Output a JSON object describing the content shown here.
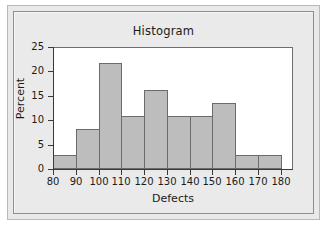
{
  "figure": {
    "title": "Histogram",
    "bar_fill_color": "#bdbdbd",
    "bar_edge_color": "#6b6b6b",
    "axis_color": "#3a3a3a",
    "plot_background": "#ffffff",
    "panel_background": "#e9e9e9"
  },
  "chart_data": {
    "type": "bar",
    "title": "Histogram",
    "xlabel": "Defects",
    "ylabel": "Percent",
    "xlim": [
      80,
      185
    ],
    "ylim": [
      0,
      25
    ],
    "bin_width": 10,
    "grid": false,
    "legend": null,
    "x_ticks": [
      80,
      90,
      100,
      110,
      120,
      130,
      140,
      150,
      160,
      170,
      180
    ],
    "x_tick_labels": [
      "80",
      "90",
      "100",
      "110",
      "120",
      "130",
      "140",
      "150",
      "160",
      "170",
      "180"
    ],
    "y_ticks": [
      0,
      5,
      10,
      15,
      20,
      25
    ],
    "y_tick_labels": [
      "0",
      "5",
      "10",
      "15",
      "20",
      "25"
    ],
    "bins": [
      {
        "label": "80-90",
        "left": 80,
        "right": 90,
        "value": 2.9
      },
      {
        "label": "90-100",
        "left": 90,
        "right": 100,
        "value": 8.1
      },
      {
        "label": "100-110",
        "left": 100,
        "right": 110,
        "value": 21.8
      },
      {
        "label": "110-120",
        "left": 110,
        "right": 120,
        "value": 10.8
      },
      {
        "label": "120-130",
        "left": 120,
        "right": 130,
        "value": 16.2
      },
      {
        "label": "130-140",
        "left": 130,
        "right": 140,
        "value": 10.8
      },
      {
        "label": "140-150",
        "left": 140,
        "right": 150,
        "value": 10.8
      },
      {
        "label": "150-160",
        "left": 150,
        "right": 160,
        "value": 13.5
      },
      {
        "label": "160-170",
        "left": 160,
        "right": 170,
        "value": 2.9
      },
      {
        "label": "170-180",
        "left": 170,
        "right": 180,
        "value": 2.9
      }
    ],
    "categories": [
      "80-90",
      "90-100",
      "100-110",
      "110-120",
      "120-130",
      "130-140",
      "140-150",
      "150-160",
      "160-170",
      "170-180"
    ],
    "values": [
      2.9,
      8.1,
      21.8,
      10.8,
      16.2,
      10.8,
      10.8,
      13.5,
      2.9,
      2.9
    ]
  }
}
